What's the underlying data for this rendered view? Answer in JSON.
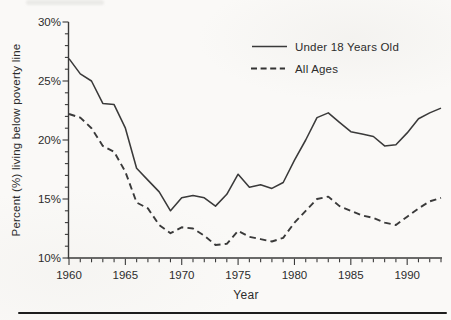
{
  "chart_data": {
    "type": "line",
    "title": "",
    "xlabel": "Year",
    "ylabel": "Percent (%) living below poverty line",
    "x_range": [
      1960,
      1993
    ],
    "ylim": [
      10,
      30
    ],
    "grid": false,
    "legend_position": "top-right-inside",
    "line_color": "#3a3a3a",
    "x": [
      1960,
      1961,
      1962,
      1963,
      1964,
      1965,
      1966,
      1967,
      1968,
      1969,
      1970,
      1971,
      1972,
      1973,
      1974,
      1975,
      1976,
      1977,
      1978,
      1979,
      1980,
      1981,
      1982,
      1983,
      1984,
      1985,
      1986,
      1987,
      1988,
      1989,
      1990,
      1991,
      1992,
      1993
    ],
    "x_major_ticks": [
      1960,
      1965,
      1970,
      1975,
      1980,
      1985,
      1990
    ],
    "x_major_tick_labels": [
      "1960",
      "1965",
      "1970",
      "1975",
      "1980",
      "1985",
      "1990"
    ],
    "x_minor_step": 1,
    "y_major_ticks": [
      10,
      15,
      20,
      25,
      30
    ],
    "y_major_tick_labels": [
      "10%",
      "15%",
      "20%",
      "25%",
      "30%"
    ],
    "y_minor_step": 1,
    "series": [
      {
        "name": "Under 18 Years Old",
        "line_style": "solid",
        "values": [
          26.9,
          25.6,
          25.0,
          23.1,
          23.0,
          21.0,
          17.6,
          16.6,
          15.6,
          14.0,
          15.1,
          15.3,
          15.1,
          14.4,
          15.4,
          17.1,
          16.0,
          16.2,
          15.9,
          16.4,
          18.3,
          20.0,
          21.9,
          22.3,
          21.5,
          20.7,
          20.5,
          20.3,
          19.5,
          19.6,
          20.6,
          21.8,
          22.3,
          22.7
        ]
      },
      {
        "name": "All Ages",
        "line_style": "dashed",
        "values": [
          22.2,
          21.9,
          21.0,
          19.5,
          19.0,
          17.3,
          14.7,
          14.2,
          12.8,
          12.1,
          12.6,
          12.5,
          11.9,
          11.1,
          11.2,
          12.3,
          11.8,
          11.6,
          11.4,
          11.7,
          13.0,
          14.0,
          15.0,
          15.2,
          14.4,
          14.0,
          13.6,
          13.4,
          13.0,
          12.8,
          13.5,
          14.2,
          14.8,
          15.1
        ]
      }
    ]
  }
}
